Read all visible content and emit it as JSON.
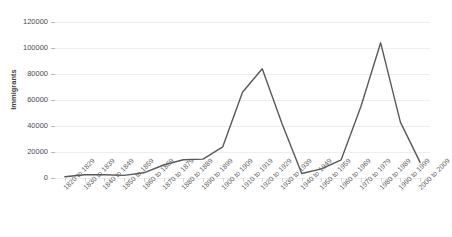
{
  "chart_data": {
    "type": "line",
    "title": "",
    "xlabel": "",
    "ylabel": "Immigrants",
    "ylim": [
      0,
      120000
    ],
    "y_ticks": [
      0,
      20000,
      40000,
      60000,
      80000,
      100000,
      120000
    ],
    "y_tick_labels": [
      "0",
      "20000",
      "40000",
      "60000",
      "80000",
      "100000",
      "120000"
    ],
    "grid": true,
    "legend": "none",
    "line_color": "#595959",
    "categories": [
      "1820 to 1829",
      "1830 to 1839",
      "1840 to 1849",
      "1850 to 1859",
      "1860 to 1869",
      "1870 to 1879",
      "1880 to 1889",
      "1890 to 1899",
      "1900 to 1909",
      "1910 to 1919",
      "1920 to 1929",
      "1930 to 1939",
      "1940 to 1949",
      "1950 to 1959",
      "1960 to 1969",
      "1970 to 1979",
      "1980 to 1989",
      "1990 to 1999",
      "2000 to 2009"
    ],
    "values": [
      1000,
      2500,
      2500,
      2000,
      4000,
      10000,
      14000,
      14500,
      24000,
      66000,
      84000,
      42000,
      3500,
      7000,
      14000,
      55000,
      104000,
      43000,
      12000
    ]
  }
}
